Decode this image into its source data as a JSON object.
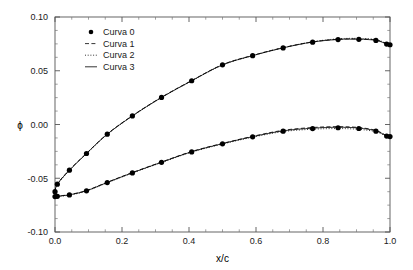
{
  "chart_data": {
    "type": "line",
    "title": "",
    "xlabel": "x/c",
    "ylabel": "ϕ",
    "xlim": [
      0.0,
      1.0
    ],
    "ylim": [
      -0.1,
      0.1
    ],
    "xticks": [
      "0.0",
      "0.2",
      "0.4",
      "0.6",
      "0.8",
      "1.0"
    ],
    "xtick_values": [
      0.0,
      0.2,
      0.4,
      0.6,
      0.8,
      1.0
    ],
    "yticks": [
      "0.10",
      "0.05",
      "0.00",
      "-0.05",
      "-0.10"
    ],
    "ytick_values": [
      0.1,
      0.05,
      0.0,
      -0.05,
      -0.1
    ],
    "xminor_step": 0.05,
    "yminor_step": 0.0125,
    "grid": false,
    "legend_position": "upper left",
    "legend": [
      {
        "label": "Curva 0",
        "style": "marker",
        "marker": "filled-circle"
      },
      {
        "label": "Curva 1",
        "style": "dashed"
      },
      {
        "label": "Curva 2",
        "style": "dotted"
      },
      {
        "label": "Curva 3",
        "style": "solid"
      }
    ],
    "series": [
      {
        "name": "Curva 0",
        "style": "marker",
        "branch": "upper",
        "x": [
          0.0,
          0.007,
          0.043,
          0.094,
          0.156,
          0.231,
          0.318,
          0.408,
          0.5,
          0.59,
          0.681,
          0.769,
          0.845,
          0.907,
          0.958,
          0.99,
          1.0
        ],
        "y": [
          -0.0625,
          -0.0555,
          -0.0425,
          -0.027,
          -0.009,
          0.008,
          0.0252,
          0.0407,
          0.0555,
          0.064,
          0.0712,
          0.0766,
          0.079,
          0.0792,
          0.0782,
          0.0748,
          0.0742
        ]
      },
      {
        "name": "Curva 0",
        "style": "marker",
        "branch": "lower",
        "x": [
          0.0,
          0.007,
          0.043,
          0.094,
          0.156,
          0.231,
          0.318,
          0.408,
          0.5,
          0.59,
          0.681,
          0.769,
          0.845,
          0.907,
          0.958,
          0.99,
          1.0
        ],
        "y": [
          -0.067,
          -0.0668,
          -0.0655,
          -0.0617,
          -0.054,
          -0.045,
          -0.0352,
          -0.0255,
          -0.018,
          -0.0115,
          -0.0062,
          -0.0038,
          -0.003,
          -0.0037,
          -0.0062,
          -0.0108,
          -0.0112
        ]
      },
      {
        "name": "Curva 1",
        "style": "dashed",
        "branch": "upper",
        "x": [
          0.0,
          0.007,
          0.043,
          0.094,
          0.156,
          0.231,
          0.318,
          0.408,
          0.5,
          0.59,
          0.681,
          0.769,
          0.845,
          0.907,
          0.958,
          0.99,
          1.0
        ],
        "y": [
          -0.0625,
          -0.0552,
          -0.0422,
          -0.0268,
          -0.0088,
          0.0082,
          0.0254,
          0.0409,
          0.0557,
          0.0643,
          0.0715,
          0.0768,
          0.0793,
          0.0796,
          0.0786,
          0.0752,
          0.0745
        ]
      },
      {
        "name": "Curva 1",
        "style": "dashed",
        "branch": "lower",
        "x": [
          0.0,
          0.007,
          0.043,
          0.094,
          0.156,
          0.231,
          0.318,
          0.408,
          0.5,
          0.59,
          0.681,
          0.769,
          0.845,
          0.907,
          0.958,
          0.99,
          1.0
        ],
        "y": [
          -0.067,
          -0.0666,
          -0.0652,
          -0.0614,
          -0.0537,
          -0.0447,
          -0.0349,
          -0.0251,
          -0.0176,
          -0.011,
          -0.0054,
          -0.0028,
          -0.002,
          -0.0028,
          -0.0055,
          -0.0104,
          -0.011
        ]
      },
      {
        "name": "Curva 2",
        "style": "dotted",
        "branch": "upper",
        "x": [
          0.0,
          0.007,
          0.043,
          0.094,
          0.156,
          0.231,
          0.318,
          0.408,
          0.5,
          0.59,
          0.681,
          0.769,
          0.845,
          0.907,
          0.958,
          0.99,
          1.0
        ],
        "y": [
          -0.0625,
          -0.0558,
          -0.0428,
          -0.0272,
          -0.0092,
          0.0078,
          0.025,
          0.0405,
          0.0553,
          0.064,
          0.0714,
          0.077,
          0.0797,
          0.0801,
          0.079,
          0.0754,
          0.0746
        ]
      },
      {
        "name": "Curva 2",
        "style": "dotted",
        "branch": "lower",
        "x": [
          0.0,
          0.007,
          0.043,
          0.094,
          0.156,
          0.231,
          0.318,
          0.408,
          0.5,
          0.59,
          0.681,
          0.769,
          0.845,
          0.907,
          0.958,
          0.99,
          1.0
        ],
        "y": [
          -0.067,
          -0.0669,
          -0.0657,
          -0.0619,
          -0.0542,
          -0.0452,
          -0.0354,
          -0.0257,
          -0.0182,
          -0.0118,
          -0.0066,
          -0.0044,
          -0.0038,
          -0.0045,
          -0.0068,
          -0.0112,
          -0.0116
        ]
      },
      {
        "name": "Curva 3",
        "style": "solid",
        "branch": "upper",
        "x": [
          0.0,
          0.007,
          0.043,
          0.094,
          0.156,
          0.231,
          0.318,
          0.408,
          0.5,
          0.59,
          0.681,
          0.769,
          0.845,
          0.907,
          0.958,
          0.99,
          1.0
        ],
        "y": [
          -0.0625,
          -0.0555,
          -0.0425,
          -0.027,
          -0.009,
          0.008,
          0.0252,
          0.0407,
          0.0555,
          0.0641,
          0.0713,
          0.0767,
          0.0791,
          0.0793,
          0.0783,
          0.0749,
          0.0743
        ]
      },
      {
        "name": "Curva 3",
        "style": "solid",
        "branch": "lower",
        "x": [
          0.0,
          0.007,
          0.043,
          0.094,
          0.156,
          0.231,
          0.318,
          0.408,
          0.5,
          0.59,
          0.681,
          0.769,
          0.845,
          0.907,
          0.958,
          0.99,
          1.0
        ],
        "y": [
          -0.067,
          -0.0667,
          -0.0654,
          -0.0616,
          -0.0539,
          -0.0449,
          -0.0351,
          -0.0253,
          -0.0178,
          -0.0113,
          -0.0059,
          -0.0034,
          -0.0026,
          -0.0033,
          -0.0059,
          -0.0106,
          -0.0113
        ]
      }
    ]
  },
  "layout": {
    "plot_left": 55,
    "plot_right": 390,
    "plot_top": 17,
    "plot_bottom": 232
  }
}
